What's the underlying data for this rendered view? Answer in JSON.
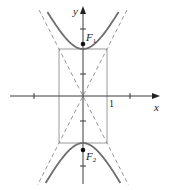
{
  "figure": {
    "axes": {
      "x_label": "x",
      "y_label": "y",
      "tick_label_x": "1"
    },
    "foci": [
      {
        "label": "F",
        "subscript": "1"
      },
      {
        "label": "F",
        "subscript": "2"
      }
    ],
    "colors": {
      "hyperbola": "#6e6e6e",
      "axes": "#3a3a3a",
      "box": "#9a9a9a",
      "asymptote": "#8a8a8a",
      "focus": "#111111",
      "background": "#ffffff"
    },
    "geometry": {
      "center_px": [
        83,
        96
      ],
      "a_px": 47,
      "b_px": 24,
      "hyperbola_y_extent_px": [
        12,
        183
      ],
      "x_axis_px": [
        10,
        160
      ],
      "y_axis_px": [
        6,
        184
      ],
      "x_ticks_px": [
        34,
        130
      ],
      "y_ticks_px": [
        29,
        74,
        121,
        166
      ],
      "focus_y_px": [
        44,
        150
      ]
    }
  }
}
